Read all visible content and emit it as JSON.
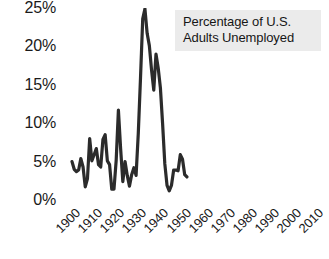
{
  "chart_data": {
    "type": "line",
    "title": "Percentage of U.S. Adults Unemployed",
    "title_lines": [
      "Percentage of U.S.",
      "Adults Unemployed"
    ],
    "xlabel": "",
    "ylabel": "",
    "grid": false,
    "legend_position": "top-right-box",
    "line_color": "#2b2b2b",
    "title_box_color": "#ebebeb",
    "background_color": "#ffffff",
    "xlim": [
      1900,
      2010
    ],
    "ylim": [
      0,
      25
    ],
    "xticks": [
      "1900",
      "1910",
      "1920",
      "1930",
      "1940",
      "1950",
      "1960",
      "1970",
      "1980",
      "1990",
      "2000",
      "2010"
    ],
    "yticks": [
      "0%",
      "5%",
      "10%",
      "15%",
      "20%",
      "25%"
    ],
    "ytick_values": [
      0,
      5,
      10,
      15,
      20,
      25
    ],
    "series": [
      {
        "name": "Percentage of U.S. Adults Unemployed",
        "x": [
          1900,
          1901,
          1902,
          1903,
          1904,
          1905,
          1906,
          1907,
          1908,
          1909,
          1910,
          1911,
          1912,
          1913,
          1914,
          1915,
          1916,
          1917,
          1918,
          1919,
          1920,
          1921,
          1922,
          1923,
          1924,
          1925,
          1926,
          1927,
          1928,
          1929,
          1930,
          1931,
          1932,
          1933,
          1934,
          1935,
          1936,
          1937,
          1938,
          1939,
          1940,
          1941,
          1942,
          1943,
          1944,
          1945,
          1946,
          1947,
          1948,
          1949,
          1950,
          1951,
          1952
        ],
        "values": [
          5.0,
          4.0,
          3.7,
          3.9,
          5.4,
          4.3,
          1.7,
          2.8,
          8.0,
          5.1,
          5.9,
          6.7,
          4.6,
          4.3,
          7.9,
          8.5,
          5.1,
          4.6,
          1.4,
          1.4,
          5.2,
          11.7,
          6.7,
          2.4,
          5.0,
          3.2,
          1.8,
          3.3,
          4.2,
          3.2,
          8.7,
          15.9,
          23.6,
          24.9,
          21.7,
          20.1,
          16.9,
          14.3,
          19.0,
          17.2,
          14.6,
          9.9,
          4.7,
          1.9,
          1.2,
          1.9,
          3.9,
          3.9,
          3.8,
          5.9,
          5.3,
          3.3,
          3.0
        ]
      }
    ]
  },
  "chart": {
    "y_axis": {
      "name": "y-axis",
      "ticks": [
        {
          "label": "25%",
          "value": 25
        },
        {
          "label": "20%",
          "value": 20
        },
        {
          "label": "15%",
          "value": 15
        },
        {
          "label": "10%",
          "value": 10
        },
        {
          "label": "5%",
          "value": 5
        },
        {
          "label": "0%",
          "value": 0
        }
      ]
    },
    "x_axis": {
      "name": "x-axis",
      "ticks": [
        {
          "label": "1900",
          "value": 1900
        },
        {
          "label": "1910",
          "value": 1910
        },
        {
          "label": "1920",
          "value": 1920
        },
        {
          "label": "1930",
          "value": 1930
        },
        {
          "label": "1940",
          "value": 1940
        },
        {
          "label": "1950",
          "value": 1950
        },
        {
          "label": "1960",
          "value": 1960
        },
        {
          "label": "1970",
          "value": 1970
        },
        {
          "label": "1980",
          "value": 1980
        },
        {
          "label": "1990",
          "value": 1990
        },
        {
          "label": "2000",
          "value": 2000
        },
        {
          "label": "2010",
          "value": 2010
        }
      ]
    },
    "title_box": {
      "line1": "Percentage of U.S.",
      "line2": "Adults Unemployed"
    }
  }
}
